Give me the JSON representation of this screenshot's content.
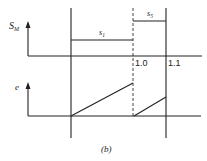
{
  "figure": {
    "caption": "(b)",
    "top_plot": {
      "y_label": "S",
      "y_label_sub": "M",
      "segments": [
        {
          "label": "s",
          "sub": "1",
          "x_start": 71,
          "x_end": 133,
          "y": 40
        },
        {
          "label": "s",
          "sub": "5",
          "x_start": 133,
          "x_end": 166,
          "y": 21
        }
      ],
      "x_ticks": [
        {
          "label": "1.0",
          "x": 133
        },
        {
          "label": "1.1",
          "x": 166
        }
      ]
    },
    "bottom_plot": {
      "y_label": "e",
      "ramps": [
        {
          "x_start": 71,
          "y_start": 116,
          "x_end": 133,
          "y_end": 83
        },
        {
          "x_start": 134,
          "y_start": 116,
          "x_end": 166,
          "y_end": 97
        }
      ]
    },
    "markers": [
      {
        "type": "solid",
        "x": 71
      },
      {
        "type": "dashed",
        "x": 133
      },
      {
        "type": "solid",
        "x": 166
      }
    ]
  },
  "colors": {
    "line": "#222222",
    "background": "#ffffff"
  }
}
